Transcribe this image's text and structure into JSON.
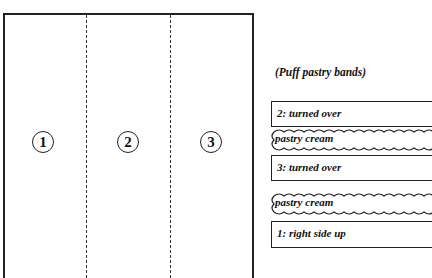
{
  "diagram": {
    "sheet_panels": [
      {
        "label": "1"
      },
      {
        "label": "2"
      },
      {
        "label": "3"
      }
    ],
    "caption": "(Puff pastry bands)",
    "layers": [
      {
        "type": "band",
        "label": "2: turned over"
      },
      {
        "type": "cream",
        "label": "pastry cream"
      },
      {
        "type": "band",
        "label": "3: turned over"
      },
      {
        "type": "cream",
        "label": "pastry cream"
      },
      {
        "type": "band",
        "label": "1: right side up"
      }
    ]
  }
}
